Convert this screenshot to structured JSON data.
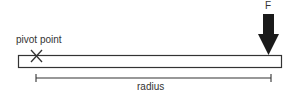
{
  "diagram": {
    "type": "lever-torque",
    "labels": {
      "pivot": "pivot point",
      "force": "F",
      "radius": "radius"
    },
    "colors": {
      "stroke": "#333333",
      "arrow": "#1a1a1a",
      "background": "#ffffff"
    }
  }
}
